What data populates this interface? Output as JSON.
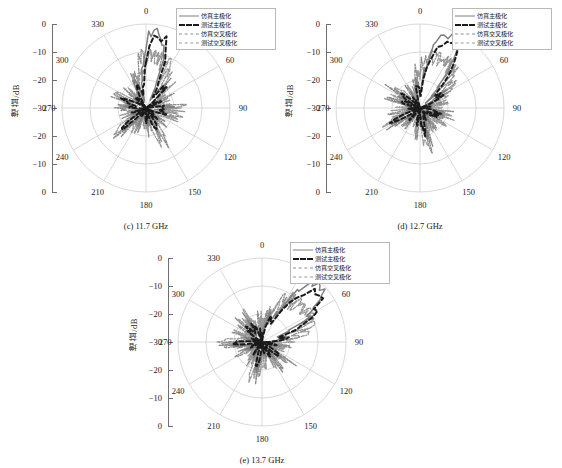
{
  "figure": {
    "axis_label": "增益/dB",
    "radial_ticks": [
      "0",
      "-10",
      "-20",
      "-30",
      "-20",
      "-10",
      "0"
    ],
    "angle_ticks": [
      "0",
      "30",
      "60",
      "90",
      "120",
      "150",
      "180",
      "210",
      "240",
      "270",
      "300",
      "330"
    ],
    "colors": {
      "sim_main": "#808080",
      "meas_main": "#1a1a1a",
      "sim_cross": "#8c8c8c",
      "meas_cross": "#9a9a9a",
      "grid": "#c8c8c8",
      "axis": "#6f6f6f",
      "text": "#1a1a1a"
    }
  },
  "legend": {
    "items": [
      {
        "label": "仿真主极化",
        "style": "solid",
        "color": "#808080"
      },
      {
        "label": "测试主极化",
        "style": "dashed-thick",
        "color": "#1a1a1a"
      },
      {
        "label": "仿真交叉极化",
        "style": "dashdot",
        "color": "#8c8c8c"
      },
      {
        "label": "测试交叉极化",
        "style": "dashdot2",
        "color": "#9a9a9a"
      }
    ]
  },
  "panels": [
    {
      "id": "c",
      "caption": "(c) 11.7 GHz",
      "beam_deg": 8,
      "beam_peak": 0.97,
      "beam_width": 11,
      "seed": 11
    },
    {
      "id": "d",
      "caption": "(d) 12.7 GHz",
      "beam_deg": 23,
      "beam_peak": 0.95,
      "beam_width": 13,
      "seed": 27
    },
    {
      "id": "e",
      "caption": "(e) 13.7 GHz",
      "beam_deg": 47,
      "beam_peak": 0.93,
      "beam_width": 15,
      "seed": 37
    }
  ],
  "chart_data": {
    "type": "line",
    "subtype": "polar-radiation-pattern",
    "title": "",
    "xlabel": "",
    "ylabel": "增益/dB",
    "rlim": [
      -30,
      0
    ],
    "r_ticks": [
      -30,
      -20,
      -10,
      0
    ],
    "theta_ticks": [
      0,
      30,
      60,
      90,
      120,
      150,
      180,
      210,
      240,
      270,
      300,
      330
    ],
    "theta_unit": "degree",
    "grid": true,
    "legend_position": "top-right",
    "panels": [
      {
        "label": "(c) 11.7 GHz",
        "frequency_ghz": 11.7,
        "series": [
          {
            "name": "仿真主极化",
            "style": "solid",
            "peak_db": -0.5,
            "peak_theta_deg": 8,
            "beamwidth_deg": 11
          },
          {
            "name": "测试主极化",
            "style": "dashed",
            "peak_db": -3.0,
            "peak_theta_deg": 10,
            "beamwidth_deg": 13
          },
          {
            "name": "仿真交叉极化",
            "style": "dashdot",
            "peak_db": -22.0,
            "peak_theta_deg": 0
          },
          {
            "name": "测试交叉极化",
            "style": "dashdot",
            "peak_db": -20.0,
            "peak_theta_deg": 0
          }
        ]
      },
      {
        "label": "(d) 12.7 GHz",
        "frequency_ghz": 12.7,
        "series": [
          {
            "name": "仿真主极化",
            "style": "solid",
            "peak_db": -1.0,
            "peak_theta_deg": 23,
            "beamwidth_deg": 13
          },
          {
            "name": "测试主极化",
            "style": "dashed",
            "peak_db": -4.0,
            "peak_theta_deg": 25,
            "beamwidth_deg": 15
          },
          {
            "name": "仿真交叉极化",
            "style": "dashdot",
            "peak_db": -20.0,
            "peak_theta_deg": 0
          },
          {
            "name": "测试交叉极化",
            "style": "dashdot",
            "peak_db": -19.0,
            "peak_theta_deg": 0
          }
        ]
      },
      {
        "label": "(e) 13.7 GHz",
        "frequency_ghz": 13.7,
        "series": [
          {
            "name": "仿真主极化",
            "style": "solid",
            "peak_db": -2.0,
            "peak_theta_deg": 47,
            "beamwidth_deg": 15
          },
          {
            "name": "测试主极化",
            "style": "dashed",
            "peak_db": -5.0,
            "peak_theta_deg": 50,
            "beamwidth_deg": 17
          },
          {
            "name": "仿真交叉极化",
            "style": "dashdot",
            "peak_db": -18.0,
            "peak_theta_deg": 0
          },
          {
            "name": "测试交叉极化",
            "style": "dashdot",
            "peak_db": -17.0,
            "peak_theta_deg": 0
          }
        ]
      }
    ]
  }
}
